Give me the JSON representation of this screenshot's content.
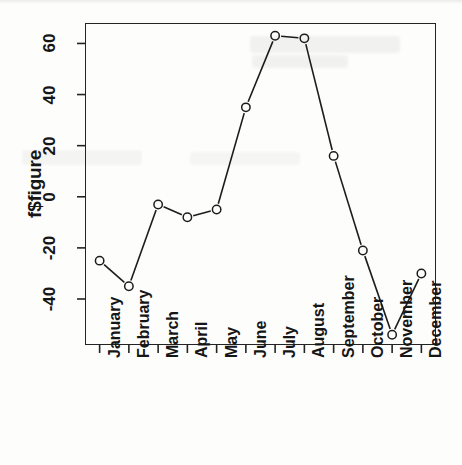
{
  "figure": {
    "title": "",
    "y_axis_label": "f$figure",
    "point_symbol": "open-circle"
  },
  "chart_data": {
    "type": "line",
    "title": "",
    "subtitle": "",
    "xlabel": "",
    "ylabel": "f$figure",
    "categories": [
      "January",
      "February",
      "March",
      "April",
      "May",
      "June",
      "July",
      "August",
      "September",
      "October",
      "November",
      "December"
    ],
    "values": [
      -25,
      -35,
      -3,
      -8,
      -5,
      35,
      63,
      62,
      16,
      -21,
      -54,
      -30
    ],
    "series": [
      {
        "name": "f$figure",
        "values": [
          -25,
          -35,
          -3,
          -8,
          -5,
          35,
          63,
          62,
          16,
          -21,
          -54,
          -30
        ]
      }
    ],
    "ylim": [
      -58,
      68
    ],
    "xlim": [
      0.5,
      12.5
    ],
    "ytick_labels": [
      "60",
      "40",
      "20",
      "0",
      "-20",
      "-40"
    ],
    "ytick_values": [
      60,
      40,
      20,
      0,
      -20,
      -40
    ],
    "xtick_labels": [
      "January",
      "February",
      "March",
      "April",
      "May",
      "June",
      "July",
      "August",
      "September",
      "October",
      "November",
      "December"
    ],
    "grid": false,
    "legend": false,
    "legend_position": "none",
    "marker": "open-circle",
    "line_style": "solid",
    "line_color": "#1c1c1c",
    "marker_color": "#1c1c1c",
    "annotations": []
  },
  "style": {
    "background": "#fdfdfc",
    "axis_color": "#232323",
    "text_color": "#161616"
  }
}
